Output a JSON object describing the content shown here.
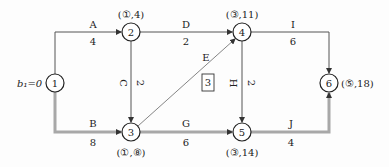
{
  "diagram": {
    "type": "double-code network diagram",
    "start_label": "b₁=0",
    "nodes": [
      {
        "id": "1",
        "x": 55,
        "y": 83,
        "annotation": ""
      },
      {
        "id": "2",
        "x": 131,
        "y": 32,
        "annotation": "(①,4)"
      },
      {
        "id": "3",
        "x": 131,
        "y": 132,
        "annotation": "(①,8)"
      },
      {
        "id": "4",
        "x": 242,
        "y": 32,
        "annotation": "(③,11)"
      },
      {
        "id": "5",
        "x": 242,
        "y": 132,
        "annotation": "(③,14)"
      },
      {
        "id": "6",
        "x": 329,
        "y": 83,
        "annotation": "(⑤,18)"
      }
    ],
    "activities": [
      {
        "name": "A",
        "duration": "4",
        "from": "1",
        "to": "2",
        "critical": false
      },
      {
        "name": "B",
        "duration": "8",
        "from": "1",
        "to": "3",
        "critical": true
      },
      {
        "name": "C",
        "duration": "2",
        "from": "2",
        "to": "3",
        "critical": false
      },
      {
        "name": "D",
        "duration": "2",
        "from": "2",
        "to": "4",
        "critical": false
      },
      {
        "name": "E",
        "duration": "3",
        "from": "3",
        "to": "4",
        "critical": false
      },
      {
        "name": "G",
        "duration": "6",
        "from": "3",
        "to": "5",
        "critical": true
      },
      {
        "name": "H",
        "duration": "2",
        "from": "4",
        "to": "5",
        "critical": false
      },
      {
        "name": "I",
        "duration": "6",
        "from": "4",
        "to": "6",
        "critical": false
      },
      {
        "name": "J",
        "duration": "4",
        "from": "5",
        "to": "6",
        "critical": true
      }
    ]
  },
  "labels": {
    "start": "b₁=0",
    "n1": "1",
    "n2": "2",
    "n3": "3",
    "n4": "4",
    "n5": "5",
    "n6": "6",
    "n2_ann": "(①,4)",
    "n3_ann": "(①,⑧)",
    "n4_ann": "(③,11)",
    "n5_ann": "(③,14)",
    "n6_ann": "(⑤,18)",
    "A": "A",
    "A_d": "4",
    "B": "B",
    "B_d": "8",
    "C": "C",
    "C_d": "2",
    "D": "D",
    "D_d": "2",
    "E": "E",
    "E_d": "3",
    "G": "G",
    "G_d": "6",
    "H": "H",
    "H_d": "2",
    "I": "I",
    "I_d": "6",
    "J": "J",
    "J_d": "4"
  },
  "colors": {
    "line": "#555555",
    "critical": "#9a9a9a",
    "text": "#222222"
  }
}
